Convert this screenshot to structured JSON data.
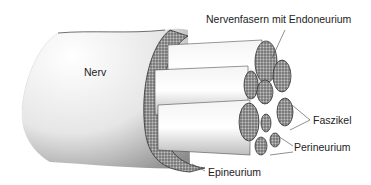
{
  "figure": {
    "labels": {
      "nerve": "Nerv",
      "nerve_fibers": "Nervenfasern mit Endoneurium",
      "fascicle": "Faszikel",
      "perineurium": "Perineurium",
      "epineurium": "Epineurium"
    }
  }
}
